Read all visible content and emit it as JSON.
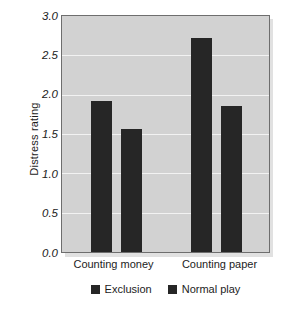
{
  "chart_data": {
    "type": "bar",
    "title": "",
    "xlabel": "",
    "ylabel": "Distress rating",
    "categories": [
      "Counting money",
      "Counting paper"
    ],
    "series": [
      {
        "name": "Exclusion",
        "values": [
          1.92,
          2.72
        ],
        "color": "#262626"
      },
      {
        "name": "Normal play",
        "values": [
          1.56,
          1.86
        ],
        "color": "#262626"
      }
    ],
    "ylim": [
      0.0,
      3.0
    ],
    "yticks": [
      "0.0",
      "0.5",
      "1.0",
      "1.5",
      "2.0",
      "2.5",
      "3.0"
    ],
    "ytick_values": [
      0.0,
      0.5,
      1.0,
      1.5,
      2.0,
      2.5,
      3.0
    ],
    "grid": true,
    "legend_position": "bottom",
    "plot_background": "#d2d2d2",
    "gridline_color": "#f2f2f2",
    "bar_color": "#262626"
  },
  "legend": {
    "items": [
      {
        "label": "Exclusion"
      },
      {
        "label": "Normal play"
      }
    ]
  }
}
